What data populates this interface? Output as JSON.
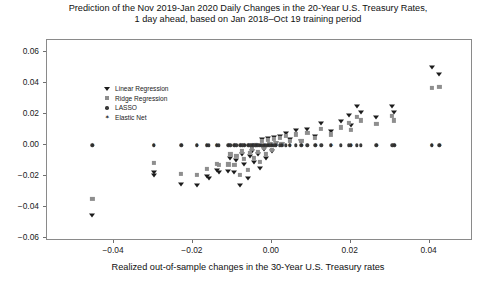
{
  "chart_data": {
    "type": "scatter",
    "title": "Prediction of the Nov 2019-Jan 2020 Daily Changes in the 20-Year U.S. Treasury Rates, 1 day ahead, based on Jan 2018–Oct 19 training period",
    "title_line1": "Prediction of the Nov 2019-Jan 2020 Daily Changes in the 20-Year U.S. Treasury Rates,",
    "title_line2": "1 day ahead, based on Jan 2018–Oct 19 training period",
    "xlabel": "Realized out-of-sample changes in the 30-Year U.S. Treasury rates",
    "ylabel": "",
    "xlim": [
      -0.057,
      0.051
    ],
    "ylim": [
      -0.062,
      0.068
    ],
    "xticks": [
      -0.04,
      -0.02,
      0.0,
      0.02,
      0.04
    ],
    "xticklabels": [
      "−0.04",
      "−0.02",
      "0.00",
      "0.02",
      "0.04"
    ],
    "yticks": [
      -0.06,
      -0.04,
      -0.02,
      0.0,
      0.02,
      0.04,
      0.06
    ],
    "yticklabels": [
      "−0.06",
      "−0.04",
      "−0.02",
      "0.00",
      "0.02",
      "0.04",
      "0.06"
    ],
    "grid": false,
    "legend_position": "upper left",
    "series": [
      {
        "name": "Linear Regression",
        "marker": "triangle-down",
        "color": "#1c1c1c",
        "points": [
          [
            -0.0455,
            -0.0455
          ],
          [
            -0.03,
            -0.0175
          ],
          [
            -0.03,
            -0.0195
          ],
          [
            -0.023,
            -0.025
          ],
          [
            -0.019,
            -0.0255
          ],
          [
            -0.0165,
            -0.02
          ],
          [
            -0.016,
            -0.0215
          ],
          [
            -0.014,
            -0.016
          ],
          [
            -0.0135,
            -0.0175
          ],
          [
            -0.011,
            -0.0165
          ],
          [
            -0.0105,
            -0.0085
          ],
          [
            -0.0095,
            -0.0175
          ],
          [
            -0.009,
            -0.0095
          ],
          [
            -0.008,
            -0.0255
          ],
          [
            -0.0075,
            -0.006
          ],
          [
            -0.007,
            -0.012
          ],
          [
            -0.006,
            -0.0215
          ],
          [
            -0.0055,
            -0.007
          ],
          [
            -0.005,
            -0.0035
          ],
          [
            -0.0045,
            -0.011
          ],
          [
            -0.004,
            0.0
          ],
          [
            -0.0035,
            -0.006
          ],
          [
            -0.003,
            -0.015
          ],
          [
            -0.0025,
            0.004
          ],
          [
            -0.002,
            -0.0025
          ],
          [
            -0.0015,
            -0.0085
          ],
          [
            -0.001,
            0.0045
          ],
          [
            -0.0005,
            0.001
          ],
          [
            0.0,
            -0.004
          ],
          [
            0.0005,
            0.0055
          ],
          [
            0.001,
            0.0015
          ],
          [
            0.002,
            0.006
          ],
          [
            0.0025,
            0.0005
          ],
          [
            0.0035,
            0.008
          ],
          [
            0.0045,
            0.004
          ],
          [
            0.006,
            0.0095
          ],
          [
            0.0075,
            0.003
          ],
          [
            0.009,
            0.0105
          ],
          [
            0.011,
            0.006
          ],
          [
            0.0125,
            0.014
          ],
          [
            0.015,
            0.009
          ],
          [
            0.0175,
            0.0155
          ],
          [
            0.0195,
            0.0195
          ],
          [
            0.02,
            0.013
          ],
          [
            0.0215,
            0.025
          ],
          [
            0.0225,
            0.0215
          ],
          [
            0.0265,
            0.018
          ],
          [
            0.0305,
            0.0255
          ],
          [
            0.031,
            0.0215
          ],
          [
            0.0405,
            0.0505
          ],
          [
            0.0425,
            0.046
          ]
        ]
      },
      {
        "name": "Ridge Regression",
        "marker": "square",
        "color": "#8e8e8e",
        "points": [
          [
            -0.0455,
            -0.035
          ],
          [
            -0.03,
            -0.0115
          ],
          [
            -0.023,
            -0.0185
          ],
          [
            -0.019,
            -0.0195
          ],
          [
            -0.0165,
            -0.0155
          ],
          [
            -0.014,
            -0.012
          ],
          [
            -0.0135,
            -0.013
          ],
          [
            -0.011,
            -0.0125
          ],
          [
            -0.0105,
            -0.006
          ],
          [
            -0.0095,
            -0.013
          ],
          [
            -0.009,
            -0.007
          ],
          [
            -0.008,
            -0.019
          ],
          [
            -0.0075,
            -0.004
          ],
          [
            -0.007,
            -0.009
          ],
          [
            -0.006,
            -0.016
          ],
          [
            -0.0055,
            -0.005
          ],
          [
            -0.005,
            -0.0025
          ],
          [
            -0.0045,
            -0.008
          ],
          [
            -0.004,
            0.0
          ],
          [
            -0.0035,
            -0.0045
          ],
          [
            -0.003,
            -0.011
          ],
          [
            -0.0025,
            0.003
          ],
          [
            -0.002,
            -0.0015
          ],
          [
            -0.0015,
            -0.006
          ],
          [
            -0.001,
            0.0035
          ],
          [
            -0.0005,
            0.001
          ],
          [
            0.0,
            -0.003
          ],
          [
            0.0005,
            0.004
          ],
          [
            0.001,
            0.001
          ],
          [
            0.002,
            0.0045
          ],
          [
            0.0025,
            0.0005
          ],
          [
            0.0035,
            0.006
          ],
          [
            0.0045,
            0.003
          ],
          [
            0.006,
            0.007
          ],
          [
            0.0075,
            0.0025
          ],
          [
            0.009,
            0.008
          ],
          [
            0.011,
            0.0045
          ],
          [
            0.0125,
            0.0105
          ],
          [
            0.015,
            0.007
          ],
          [
            0.0175,
            0.0115
          ],
          [
            0.0195,
            0.0145
          ],
          [
            0.02,
            0.01
          ],
          [
            0.0215,
            0.0185
          ],
          [
            0.0225,
            0.016
          ],
          [
            0.0265,
            0.0135
          ],
          [
            0.0305,
            0.019
          ],
          [
            0.031,
            0.016
          ],
          [
            0.0405,
            0.037
          ],
          [
            0.0425,
            0.0375
          ]
        ]
      },
      {
        "name": "LASSO",
        "marker": "circle",
        "color": "#3a3a3a",
        "points": [
          [
            -0.0455,
            0.0
          ],
          [
            -0.03,
            0.0
          ],
          [
            -0.023,
            0.0
          ],
          [
            -0.019,
            0.0
          ],
          [
            -0.0165,
            0.0
          ],
          [
            -0.016,
            0.0
          ],
          [
            -0.014,
            0.0
          ],
          [
            -0.0135,
            0.0
          ],
          [
            -0.011,
            0.0
          ],
          [
            -0.0105,
            0.0
          ],
          [
            -0.0095,
            0.0
          ],
          [
            -0.009,
            0.0
          ],
          [
            -0.008,
            0.0
          ],
          [
            -0.0075,
            0.0
          ],
          [
            -0.007,
            0.0
          ],
          [
            -0.006,
            0.0
          ],
          [
            -0.0055,
            0.0
          ],
          [
            -0.005,
            0.0
          ],
          [
            -0.0045,
            0.0
          ],
          [
            -0.004,
            0.0
          ],
          [
            -0.0035,
            0.0
          ],
          [
            -0.003,
            0.0
          ],
          [
            -0.0025,
            0.0
          ],
          [
            -0.002,
            0.0
          ],
          [
            -0.0015,
            0.0
          ],
          [
            -0.001,
            0.0
          ],
          [
            -0.0005,
            0.0
          ],
          [
            0.0,
            0.0
          ],
          [
            0.0005,
            0.0
          ],
          [
            0.001,
            0.0
          ],
          [
            0.002,
            0.0
          ],
          [
            0.0025,
            0.0
          ],
          [
            0.0035,
            0.0
          ],
          [
            0.0045,
            0.0
          ],
          [
            0.006,
            0.0
          ],
          [
            0.0075,
            0.0
          ],
          [
            0.009,
            0.0
          ],
          [
            0.011,
            0.0
          ],
          [
            0.0125,
            0.0
          ],
          [
            0.015,
            0.0
          ],
          [
            0.0175,
            0.0
          ],
          [
            0.0195,
            0.0
          ],
          [
            0.02,
            0.0
          ],
          [
            0.0215,
            0.0
          ],
          [
            0.0225,
            0.0
          ],
          [
            0.0265,
            0.0
          ],
          [
            0.0305,
            0.0
          ],
          [
            0.031,
            0.0
          ],
          [
            0.0405,
            0.0
          ],
          [
            0.0425,
            0.0
          ]
        ]
      },
      {
        "name": "Elastic Net",
        "marker": "star",
        "color": "#2a2a2a",
        "points": [
          [
            -0.0455,
            0.0
          ],
          [
            -0.03,
            0.0
          ],
          [
            -0.023,
            0.0
          ],
          [
            -0.019,
            0.0
          ],
          [
            -0.0165,
            0.0
          ],
          [
            -0.014,
            0.0
          ],
          [
            -0.011,
            0.0
          ],
          [
            -0.0095,
            0.0
          ],
          [
            -0.008,
            0.0
          ],
          [
            -0.007,
            0.0
          ],
          [
            -0.006,
            0.0
          ],
          [
            -0.005,
            0.0
          ],
          [
            -0.004,
            0.0
          ],
          [
            -0.003,
            0.0
          ],
          [
            -0.002,
            0.0
          ],
          [
            -0.001,
            0.0
          ],
          [
            0.0,
            0.0
          ],
          [
            0.001,
            0.0
          ],
          [
            0.0025,
            0.0
          ],
          [
            0.0045,
            0.0
          ],
          [
            0.0075,
            0.0
          ],
          [
            0.011,
            0.0
          ],
          [
            0.015,
            0.0
          ],
          [
            0.02,
            0.0
          ],
          [
            0.0265,
            0.0
          ],
          [
            0.031,
            0.0
          ],
          [
            0.0405,
            0.0
          ],
          [
            0.0425,
            0.0
          ]
        ]
      }
    ]
  }
}
